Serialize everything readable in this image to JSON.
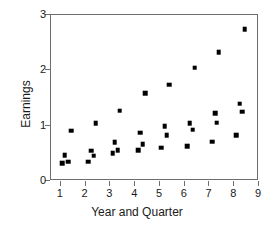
{
  "chart_data": {
    "type": "scatter",
    "title": "",
    "xlabel": "Year and Quarter",
    "ylabel": "Earnings",
    "xlim": [
      0.6,
      9.0
    ],
    "ylim": [
      0,
      3
    ],
    "xticks": [
      1,
      2,
      3,
      4,
      5,
      6,
      7,
      8,
      9
    ],
    "xtick_labels": [
      "1",
      "2",
      "3",
      "4",
      "5",
      "6",
      "7",
      "8",
      "9"
    ],
    "yticks": [
      0,
      1,
      2,
      3
    ],
    "ytick_labels": [
      "0",
      "1",
      "2",
      "3"
    ],
    "grid": false,
    "legend": false,
    "marker": "square",
    "marker_color": "#000000",
    "marker_size": 4.6,
    "frame_color": "#6e6e6e",
    "background": "#ffffff",
    "n_points": 32,
    "points": [
      {
        "x": 1.05,
        "y": 0.32
      },
      {
        "x": 1.15,
        "y": 0.47
      },
      {
        "x": 1.3,
        "y": 0.35
      },
      {
        "x": 1.42,
        "y": 0.91
      },
      {
        "x": 2.1,
        "y": 0.35
      },
      {
        "x": 2.22,
        "y": 0.55
      },
      {
        "x": 2.32,
        "y": 0.46
      },
      {
        "x": 2.4,
        "y": 1.04
      },
      {
        "x": 3.1,
        "y": 0.5
      },
      {
        "x": 3.18,
        "y": 0.7
      },
      {
        "x": 3.3,
        "y": 0.56
      },
      {
        "x": 3.38,
        "y": 1.27
      },
      {
        "x": 4.12,
        "y": 0.56
      },
      {
        "x": 4.2,
        "y": 0.87
      },
      {
        "x": 4.3,
        "y": 0.67
      },
      {
        "x": 4.4,
        "y": 1.59
      },
      {
        "x": 5.05,
        "y": 0.6
      },
      {
        "x": 5.2,
        "y": 0.99
      },
      {
        "x": 5.28,
        "y": 0.83
      },
      {
        "x": 5.38,
        "y": 1.74
      },
      {
        "x": 6.1,
        "y": 0.63
      },
      {
        "x": 6.2,
        "y": 1.04
      },
      {
        "x": 6.32,
        "y": 0.93
      },
      {
        "x": 6.4,
        "y": 2.05
      },
      {
        "x": 7.12,
        "y": 0.71
      },
      {
        "x": 7.22,
        "y": 1.22
      },
      {
        "x": 7.3,
        "y": 1.05
      },
      {
        "x": 7.38,
        "y": 2.33
      },
      {
        "x": 8.08,
        "y": 0.83
      },
      {
        "x": 8.22,
        "y": 1.4
      },
      {
        "x": 8.32,
        "y": 1.25
      },
      {
        "x": 8.42,
        "y": 2.74
      }
    ]
  }
}
